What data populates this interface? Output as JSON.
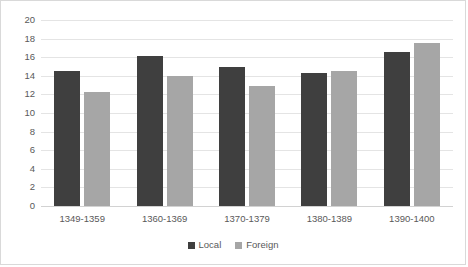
{
  "chart_data": {
    "type": "bar",
    "title": "",
    "subtitle": "",
    "xlabel": "",
    "ylabel": "",
    "categories": [
      "1349-1359",
      "1360-1369",
      "1370-1379",
      "1380-1389",
      "1390-1400"
    ],
    "series": [
      {
        "name": "Local",
        "color": "#3f3f3f",
        "values": [
          14.5,
          16.1,
          15.0,
          14.3,
          16.6
        ]
      },
      {
        "name": "Foreign",
        "color": "#a6a6a6",
        "values": [
          12.3,
          14.0,
          12.9,
          14.5,
          17.5
        ]
      }
    ],
    "ylim": [
      0,
      20
    ],
    "ytick_step": 2,
    "yticks": [
      20,
      18,
      16,
      14,
      12,
      10,
      8,
      6,
      4,
      2,
      0
    ],
    "grid": true,
    "legend_position": "bottom",
    "annotations": []
  },
  "colors": {
    "local": "#3f3f3f",
    "foreign": "#a6a6a6",
    "gridline": "#e4e4e4",
    "axis": "#d2d2d2",
    "border": "#d9d9d9",
    "text": "#595959",
    "background": "#ffffff"
  }
}
